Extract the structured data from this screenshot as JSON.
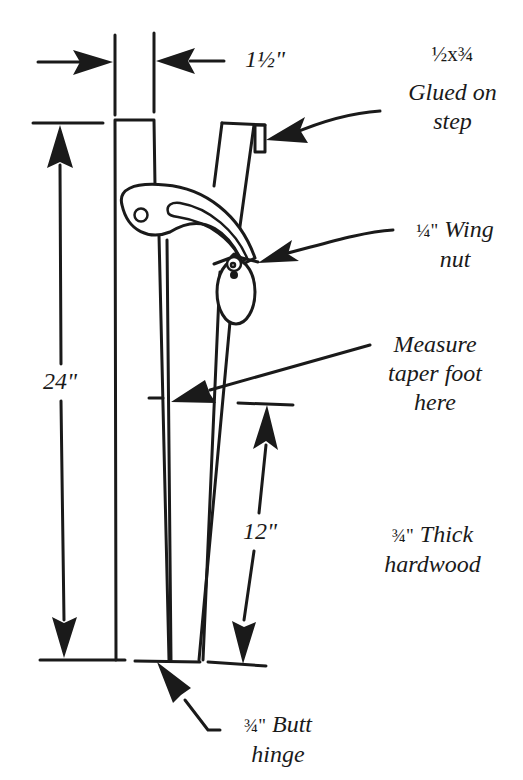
{
  "diagram": {
    "dimensions": {
      "width_top": "1½\"",
      "height_total": "24\"",
      "height_lower": "12\""
    },
    "callouts": {
      "step_size": "½x¾",
      "step_label_line1": "Glued on",
      "step_label_line2": "step",
      "wingnut_size": "¼\"",
      "wingnut_line1": "Wing",
      "wingnut_line2": "nut",
      "measure_line1": "Measure",
      "measure_line2": "taper foot",
      "measure_line3": "here",
      "thickness_size": "¾\"",
      "thickness_line1": "Thick",
      "thickness_line2": "hardwood",
      "hinge_size": "¾\"",
      "hinge_line1": "Butt",
      "hinge_line2": "hinge"
    },
    "colors": {
      "ink": "#1a1a1a",
      "paper": "#ffffff"
    }
  }
}
